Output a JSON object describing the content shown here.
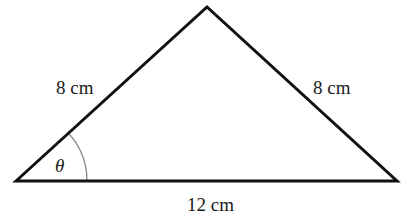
{
  "diagram": {
    "type": "isosceles-triangle",
    "vertices": {
      "left": [
        16,
        181
      ],
      "apex": [
        207,
        7
      ],
      "right": [
        397,
        181
      ]
    },
    "labels": {
      "left_side": "8 cm",
      "right_side": "8 cm",
      "base": "12 cm",
      "angle": "θ"
    },
    "colors": {
      "stroke": "#111111",
      "arc": "#888888",
      "text": "#1a1a1a"
    }
  }
}
